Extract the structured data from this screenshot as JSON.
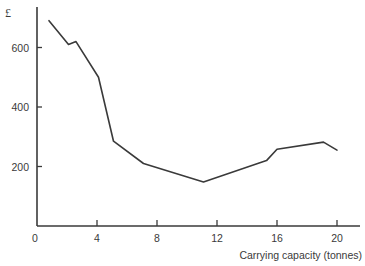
{
  "chart_data": {
    "type": "line",
    "title": "",
    "xlabel": "Carrying capacity (tonnes)",
    "ylabel": "£",
    "xlim": [
      0,
      21.5
    ],
    "ylim": [
      0,
      730
    ],
    "x_ticks": [
      0,
      4,
      8,
      12,
      16,
      20
    ],
    "y_ticks": [
      200,
      400,
      600
    ],
    "grid": false,
    "legend": null,
    "series": [
      {
        "name": "Cost",
        "color": "#3a3a3a",
        "x": [
          0.8,
          2.1,
          2.6,
          4.1,
          5.1,
          7.1,
          11.1,
          15.3,
          16.0,
          19.1,
          20.0
        ],
        "y": [
          690,
          610,
          620,
          500,
          285,
          210,
          148,
          220,
          258,
          282,
          255
        ]
      }
    ]
  },
  "axes": {
    "y_unit": "£",
    "x_title": "Carrying capacity (tonnes)",
    "x_tick_labels": [
      "0",
      "4",
      "8",
      "12",
      "16",
      "20"
    ],
    "y_tick_labels": [
      "200",
      "400",
      "600"
    ]
  }
}
